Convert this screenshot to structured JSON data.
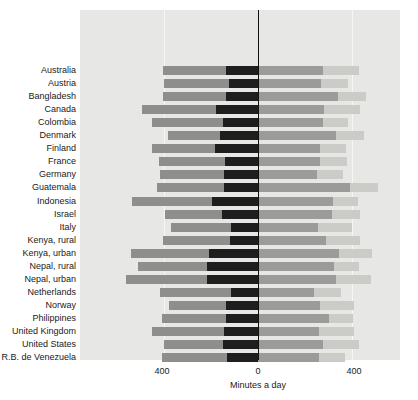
{
  "chart_data": {
    "type": "bar",
    "subtype": "diverging-stacked-bar",
    "title": "",
    "xlabel": "Minutes a day",
    "ylabel": "",
    "xticks": [
      "400",
      "0",
      "400"
    ],
    "xtick_values": [
      -400,
      0,
      400
    ],
    "xlim": [
      -480,
      480
    ],
    "grid": true,
    "legend_position": "top",
    "group_labels": {
      "left": "Women",
      "right": "Men"
    },
    "segment_labels": {
      "women_nonmarket": "Nonmarket\nactivity",
      "women_market": "Market\nactivity",
      "men_market": "Market\nactivity",
      "men_nonmarket": "Nonmarket\nactivity"
    },
    "series": [
      {
        "name": "Women nonmarket activity",
        "side": "left",
        "color": "#8e8f8c"
      },
      {
        "name": "Women market activity",
        "side": "left",
        "color": "#1e1e1e"
      },
      {
        "name": "Men market activity",
        "side": "right",
        "color": "#9b9c99"
      },
      {
        "name": "Men nonmarket activity",
        "side": "right",
        "color": "#cbccc8"
      }
    ],
    "categories": [
      "Australia",
      "Austria",
      "Bangladesh",
      "Canada",
      "Colombia",
      "Denmark",
      "Finland",
      "France",
      "Germany",
      "Guatemala",
      "Indonesia",
      "Israel",
      "Italy",
      "Kenya, rural",
      "Kenya, urban",
      "Nepal, rural",
      "Nepal, urban",
      "Netherlands",
      "Norway",
      "Philippines",
      "United Kingdom",
      "United States",
      "R.B. de Venezuela"
    ],
    "rows": [
      {
        "country": "Australia",
        "women_nonmarket": 270,
        "women_market": 135,
        "men_market": 275,
        "men_nonmarket": 155
      },
      {
        "country": "Austria",
        "women_nonmarket": 275,
        "women_market": 125,
        "men_market": 270,
        "men_nonmarket": 115
      },
      {
        "country": "Bangladesh",
        "women_nonmarket": 270,
        "women_market": 135,
        "men_market": 340,
        "men_nonmarket": 120
      },
      {
        "country": "Canada",
        "women_nonmarket": 315,
        "women_market": 180,
        "men_market": 280,
        "men_nonmarket": 155
      },
      {
        "country": "Colombia",
        "women_nonmarket": 300,
        "women_market": 150,
        "men_market": 275,
        "men_nonmarket": 110
      },
      {
        "country": "Denmark",
        "women_nonmarket": 225,
        "women_market": 160,
        "men_market": 330,
        "men_nonmarket": 120
      },
      {
        "country": "Finland",
        "women_nonmarket": 265,
        "women_market": 185,
        "men_market": 265,
        "men_nonmarket": 110
      },
      {
        "country": "France",
        "women_nonmarket": 280,
        "women_market": 140,
        "men_market": 265,
        "men_nonmarket": 115
      },
      {
        "country": "Germany",
        "women_nonmarket": 270,
        "women_market": 145,
        "men_market": 250,
        "men_nonmarket": 110
      },
      {
        "country": "Guatemala",
        "women_nonmarket": 285,
        "women_market": 145,
        "men_market": 390,
        "men_nonmarket": 120
      },
      {
        "country": "Indonesia",
        "women_nonmarket": 340,
        "women_market": 195,
        "men_market": 320,
        "men_nonmarket": 105
      },
      {
        "country": "Israel",
        "women_nonmarket": 240,
        "women_market": 155,
        "men_market": 315,
        "men_nonmarket": 120
      },
      {
        "country": "Italy",
        "women_nonmarket": 255,
        "women_market": 115,
        "men_market": 255,
        "men_nonmarket": 145
      },
      {
        "country": "Kenya, rural",
        "women_nonmarket": 285,
        "women_market": 120,
        "men_market": 290,
        "men_nonmarket": 145
      },
      {
        "country": "Kenya, urban",
        "women_nonmarket": 330,
        "women_market": 210,
        "men_market": 345,
        "men_nonmarket": 140
      },
      {
        "country": "Nepal, rural",
        "women_nonmarket": 295,
        "women_market": 215,
        "men_market": 325,
        "men_nonmarket": 105
      },
      {
        "country": "Nepal, urban",
        "women_nonmarket": 345,
        "women_market": 215,
        "men_market": 330,
        "men_nonmarket": 150
      },
      {
        "country": "Netherlands",
        "women_nonmarket": 300,
        "women_market": 115,
        "men_market": 240,
        "men_nonmarket": 115
      },
      {
        "country": "Norway",
        "women_nonmarket": 245,
        "women_market": 135,
        "men_market": 265,
        "men_nonmarket": 145
      },
      {
        "country": "Philippines",
        "women_nonmarket": 275,
        "women_market": 135,
        "men_market": 300,
        "men_nonmarket": 105
      },
      {
        "country": "United Kingdom",
        "women_nonmarket": 305,
        "women_market": 145,
        "men_market": 260,
        "men_nonmarket": 150
      },
      {
        "country": "United States",
        "women_nonmarket": 250,
        "women_market": 150,
        "men_market": 275,
        "men_nonmarket": 155
      },
      {
        "country": "R.B. de Venezuela",
        "women_nonmarket": 280,
        "women_market": 130,
        "men_market": 260,
        "men_nonmarket": 110
      }
    ]
  }
}
